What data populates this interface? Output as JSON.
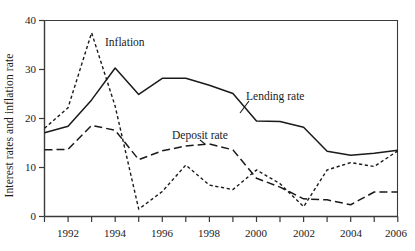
{
  "chart_data": {
    "type": "line",
    "title": "",
    "xlabel": "",
    "ylabel": "Interest rates and inflation rate",
    "xlim": [
      1991,
      2006
    ],
    "ylim": [
      0,
      40
    ],
    "grid": false,
    "legend_position": "inline-annotations",
    "y_ticks": [
      0,
      10,
      20,
      30,
      40
    ],
    "y_tick_labels": [
      "0",
      "10",
      "20",
      "30",
      "40"
    ],
    "x_ticks": [
      1991,
      1992,
      1993,
      1994,
      1995,
      1996,
      1997,
      1998,
      1999,
      2000,
      2001,
      2002,
      2003,
      2004,
      2005,
      2006
    ],
    "x_tick_labels_major": [
      "1992",
      "1994",
      "1996",
      "1998",
      "2000",
      "2002",
      "2004",
      "2006"
    ],
    "x_major_values": [
      1992,
      1994,
      1996,
      1998,
      2000,
      2002,
      2004,
      2006
    ],
    "x": [
      1991,
      1992,
      1993,
      1994,
      1995,
      1996,
      1997,
      1998,
      1999,
      2000,
      2001,
      2002,
      2003,
      2004,
      2005,
      2006
    ],
    "series": [
      {
        "name": "Lending rate",
        "style": "solid",
        "color": "#1a1a1a",
        "label": "Lending rate",
        "values": [
          17.1,
          18.4,
          23.8,
          30.3,
          24.9,
          28.2,
          28.2,
          26.8,
          25.1,
          19.5,
          19.4,
          18.2,
          13.3,
          12.5,
          12.9,
          13.5
        ]
      },
      {
        "name": "Deposit rate",
        "style": "long-dash",
        "color": "#1a1a1a",
        "label": "Deposit rate",
        "values": [
          13.6,
          13.7,
          18.6,
          17.6,
          11.6,
          13.4,
          14.4,
          14.8,
          13.6,
          7.8,
          6.0,
          3.6,
          3.4,
          2.4,
          5.0,
          5.0
        ]
      },
      {
        "name": "Inflation",
        "style": "short-dash",
        "color": "#1a1a1a",
        "label": "Inflation",
        "values": [
          18.0,
          22.2,
          37.5,
          22.5,
          1.5,
          5.1,
          10.5,
          6.4,
          5.5,
          9.5,
          6.7,
          2.0,
          9.5,
          11.0,
          10.2,
          13.4
        ]
      }
    ],
    "annotations": [
      {
        "text": "Inflation",
        "x_px": 105,
        "y_px": 36
      },
      {
        "text": "Lending rate",
        "x_px": 246,
        "y_px": 90
      },
      {
        "text": "Deposit rate",
        "x_px": 172,
        "y_px": 129
      }
    ]
  },
  "axes": {
    "y_title": "Interest rates and inflation rate"
  }
}
